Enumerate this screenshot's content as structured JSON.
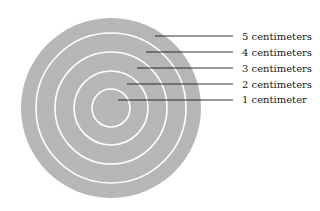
{
  "diagram": {
    "center": [
      111,
      108
    ],
    "disk_radius": 90,
    "disk_color": "#b4b4b4",
    "ring_color": "#ffffff",
    "ring_radii": [
      19,
      37,
      56,
      75
    ],
    "labels": [
      {
        "text": "5 centimeters",
        "y": 38,
        "line_start_x": 155
      },
      {
        "text": "4 centimeters",
        "y": 53,
        "line_start_x": 146
      },
      {
        "text": "3 centimeters",
        "y": 69,
        "line_start_x": 137
      },
      {
        "text": "2 centimeters",
        "y": 85,
        "line_start_x": 127
      },
      {
        "text": "1 centimeter",
        "y": 100,
        "line_start_x": 118
      }
    ]
  }
}
